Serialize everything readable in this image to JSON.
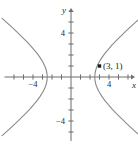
{
  "figure": {
    "background_color": "#ffffff",
    "axis_color": "#6d6d6d",
    "curve_color": "#8a8a8a",
    "label_color": "#2b2b2b",
    "point_color": "#1c1c1c"
  },
  "chart_data": {
    "type": "line",
    "title": "",
    "subtitle": "",
    "xlabel": "x",
    "ylabel": "y",
    "xlim": [
      -7,
      7
    ],
    "ylim": [
      -6.5,
      6.5
    ],
    "grid": false,
    "legend": "none",
    "x_tick_values": [
      -6,
      -5,
      -4,
      -3,
      -2,
      -1,
      1,
      2,
      3,
      4,
      5,
      6
    ],
    "y_tick_values": [
      -6,
      -5,
      -4,
      -3,
      -2,
      -1,
      1,
      2,
      3,
      4,
      5,
      6
    ],
    "x_tick_labels": [
      {
        "value": -4,
        "text": "−4"
      },
      {
        "value": 4,
        "text": "4"
      }
    ],
    "y_tick_labels": [
      {
        "value": 4,
        "text": "4"
      },
      {
        "value": -4,
        "text": "−4"
      }
    ],
    "curve_equation": "x^2/a^2 - y^2/b^2 = 1",
    "curve_description": "hyperbola opening left and right",
    "series": [
      {
        "name": "right-branch",
        "points": [
          [
            2.5,
            0.0
          ],
          [
            2.53,
            0.34
          ],
          [
            2.62,
            0.68
          ],
          [
            2.77,
            1.03
          ],
          [
            2.98,
            1.39
          ],
          [
            3.25,
            1.76
          ],
          [
            3.57,
            2.14
          ],
          [
            3.93,
            2.52
          ],
          [
            4.33,
            2.91
          ],
          [
            4.76,
            3.31
          ],
          [
            5.22,
            3.7
          ],
          [
            5.7,
            4.1
          ],
          [
            6.2,
            4.51
          ],
          [
            6.72,
            4.92
          ],
          [
            7.25,
            5.33
          ]
        ]
      },
      {
        "name": "right-branch-lower",
        "points": [
          [
            2.5,
            0.0
          ],
          [
            2.53,
            -0.34
          ],
          [
            2.62,
            -0.68
          ],
          [
            2.77,
            -1.03
          ],
          [
            2.98,
            -1.39
          ],
          [
            3.25,
            -1.76
          ],
          [
            3.57,
            -2.14
          ],
          [
            3.93,
            -2.52
          ],
          [
            4.33,
            -2.91
          ],
          [
            4.76,
            -3.31
          ],
          [
            5.22,
            -3.7
          ],
          [
            5.7,
            -4.1
          ],
          [
            6.2,
            -4.51
          ],
          [
            6.72,
            -4.92
          ],
          [
            7.25,
            -5.33
          ]
        ]
      },
      {
        "name": "left-branch",
        "points": [
          [
            -2.5,
            0.0
          ],
          [
            -2.53,
            0.34
          ],
          [
            -2.62,
            0.68
          ],
          [
            -2.77,
            1.03
          ],
          [
            -2.98,
            1.39
          ],
          [
            -3.25,
            1.76
          ],
          [
            -3.57,
            2.14
          ],
          [
            -3.93,
            2.52
          ],
          [
            -4.33,
            2.91
          ],
          [
            -4.76,
            3.31
          ],
          [
            -5.22,
            3.7
          ],
          [
            -5.7,
            4.1
          ],
          [
            -6.2,
            4.51
          ],
          [
            -6.72,
            4.92
          ],
          [
            -7.25,
            5.33
          ]
        ]
      },
      {
        "name": "left-branch-lower",
        "points": [
          [
            -2.5,
            0.0
          ],
          [
            -2.53,
            -0.34
          ],
          [
            -2.62,
            -0.68
          ],
          [
            -2.77,
            -1.03
          ],
          [
            -2.98,
            -1.39
          ],
          [
            -3.25,
            -1.76
          ],
          [
            -3.57,
            -2.14
          ],
          [
            -3.93,
            -2.52
          ],
          [
            -4.33,
            -2.91
          ],
          [
            -4.76,
            -3.31
          ],
          [
            -5.22,
            -3.7
          ],
          [
            -5.7,
            -4.1
          ],
          [
            -6.2,
            -4.51
          ],
          [
            -6.72,
            -4.92
          ],
          [
            -7.25,
            -5.33
          ]
        ]
      }
    ],
    "annotations": [
      {
        "name": "labeled-point",
        "x": 3,
        "y": 1,
        "label": "(3, 1)",
        "marker": "filled-square"
      }
    ]
  }
}
